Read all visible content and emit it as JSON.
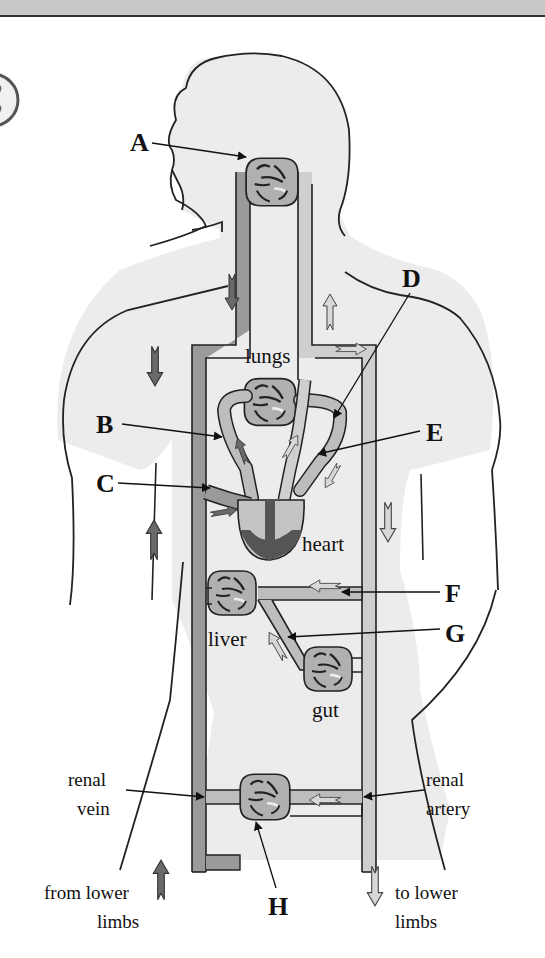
{
  "diagram": {
    "colors": {
      "body_fill": "#ececec",
      "outline": "#222222",
      "vein": "#9a9a9a",
      "artery": "#cfcfcf",
      "capillary_bed": "#b3b3b3",
      "heart_dark": "#555555",
      "top_band": "#c8c8c8"
    },
    "letters": {
      "A": "A",
      "B": "B",
      "C": "C",
      "D": "D",
      "E": "E",
      "F": "F",
      "G": "G",
      "H": "H"
    },
    "organs": {
      "lungs": "lungs",
      "heart": "heart",
      "liver": "liver",
      "gut": "gut"
    },
    "side_labels": {
      "renal_vein_1": "renal",
      "renal_vein_2": "vein",
      "renal_artery_1": "renal",
      "renal_artery_2": "artery",
      "from_lower_1": "from lower",
      "from_lower_2": "limbs",
      "to_lower_1": "to lower",
      "to_lower_2": "limbs"
    },
    "label_targets": {
      "A": "capillaries in head",
      "B": "pulmonary artery",
      "C": "vena cava",
      "D": "pulmonary vein",
      "E": "aorta",
      "F": "hepatic artery",
      "G": "hepatic portal vein",
      "H": "kidney"
    }
  }
}
